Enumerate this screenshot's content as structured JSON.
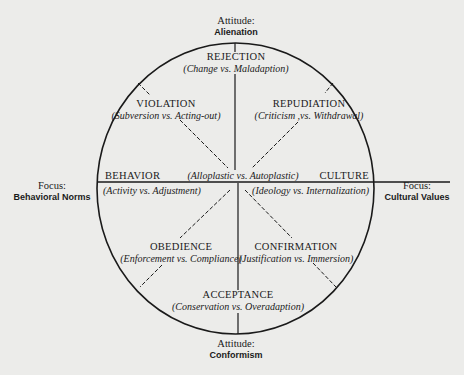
{
  "diagram": {
    "axes": {
      "top": {
        "heading": "Attitude:",
        "value": "Alienation"
      },
      "bottom": {
        "heading": "Attitude:",
        "value": "Conformism"
      },
      "left": {
        "heading": "Focus:",
        "value": "Behavioral Norms"
      },
      "right": {
        "heading": "Focus:",
        "value": "Cultural Values"
      }
    },
    "center_label": "(Alloplastic vs. Autoplastic)",
    "segments": {
      "rejection": {
        "title": "REJECTION",
        "subtitle": "(Change vs. Maladaption)"
      },
      "violation": {
        "title": "VIOLATION",
        "subtitle": "(Subversion vs. Acting-out)"
      },
      "repudiation": {
        "title": "REPUDIATION",
        "subtitle": "(Criticism ,vs. Withdrawal)"
      },
      "behavior": {
        "title": "BEHAVIOR",
        "subtitle": "(Activity vs. Adjustment)"
      },
      "culture": {
        "title": "CULTURE",
        "subtitle": "(Ideology vs. Internalization)"
      },
      "obedience": {
        "title": "OBEDIENCE",
        "subtitle": "(Enforcement vs. Compliance)"
      },
      "confirmation": {
        "title": "CONFIRMATION",
        "subtitle": "(Justification vs. Immersion)"
      },
      "acceptance": {
        "title": "ACCEPTANCE",
        "subtitle": "(Conservation vs. Overadaption)"
      }
    },
    "colors": {
      "background": "#ececea",
      "ink": "#1a1a1a"
    }
  }
}
